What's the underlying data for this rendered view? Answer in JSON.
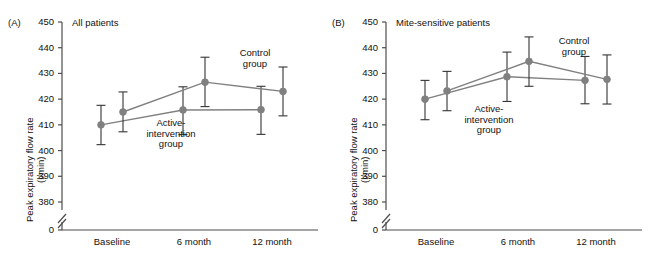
{
  "figure": {
    "width": 648,
    "height": 263,
    "series_color": "#808080",
    "axis_color": "#4d4d4d",
    "error_bar_color": "#333333",
    "text_color": "#111111"
  },
  "chart_data": [
    {
      "type": "line",
      "panel_letter": "(A)",
      "title": "All patients",
      "xlabel": "",
      "ylabel": "Peak expiratory flow rate\n(l/min)",
      "ylabel_line1": "Peak expiratory flow rate",
      "ylabel_line2": "(l/min)",
      "categories": [
        "Baseline",
        "6 month",
        "12 month"
      ],
      "yticks": [
        380,
        390,
        400,
        410,
        420,
        430,
        440,
        450
      ],
      "ytick_labels": [
        "380",
        "390",
        "400",
        "410",
        "420",
        "430",
        "440",
        "450"
      ],
      "origin_label": "0",
      "ylim": [
        380,
        450
      ],
      "axis_break": true,
      "grid": false,
      "legend": "annotations",
      "series": [
        {
          "name": "Active-intervention group",
          "annotation": "Active-\nintervention\ngroup",
          "annotation_lines": [
            "Active-",
            "intervention",
            "group"
          ],
          "values": [
            410.0,
            415.8,
            415.9
          ],
          "err_low": [
            402.3,
            406.2,
            406.3
          ],
          "err_high": [
            417.6,
            424.8,
            425.0
          ]
        },
        {
          "name": "Control group",
          "annotation": "Control\ngroup",
          "annotation_lines": [
            "Control",
            "group"
          ],
          "values": [
            415.0,
            426.6,
            423.0
          ],
          "err_low": [
            407.3,
            417.1,
            413.5
          ],
          "err_high": [
            422.8,
            436.3,
            432.5
          ]
        }
      ]
    },
    {
      "type": "line",
      "panel_letter": "(B)",
      "title": "Mite-sensitive patients",
      "xlabel": "",
      "ylabel": "Peak expiratory flow rate\n(l/min)",
      "ylabel_line1": "Peak expiratory flow rate",
      "ylabel_line2": "(l/min)",
      "categories": [
        "Baseline",
        "6 month",
        "12 month"
      ],
      "yticks": [
        380,
        390,
        400,
        410,
        420,
        430,
        440,
        450
      ],
      "ytick_labels": [
        "380",
        "390",
        "400",
        "410",
        "420",
        "430",
        "440",
        "450"
      ],
      "origin_label": "0",
      "ylim": [
        380,
        450
      ],
      "axis_break": true,
      "grid": false,
      "legend": "annotations",
      "series": [
        {
          "name": "Active-intervention group",
          "annotation": "Active-\nintervention\ngroup",
          "annotation_lines": [
            "Active-",
            "intervention",
            "group"
          ],
          "values": [
            420.0,
            428.7,
            427.3
          ],
          "err_low": [
            412.0,
            419.1,
            418.2
          ],
          "err_high": [
            427.3,
            438.3,
            436.6
          ]
        },
        {
          "name": "Control group",
          "annotation": "Control\ngroup",
          "annotation_lines": [
            "Control",
            "group"
          ],
          "values": [
            423.2,
            434.7,
            427.7
          ],
          "err_low": [
            415.5,
            425.0,
            418.1
          ],
          "err_high": [
            430.8,
            444.2,
            437.2
          ]
        }
      ]
    }
  ]
}
